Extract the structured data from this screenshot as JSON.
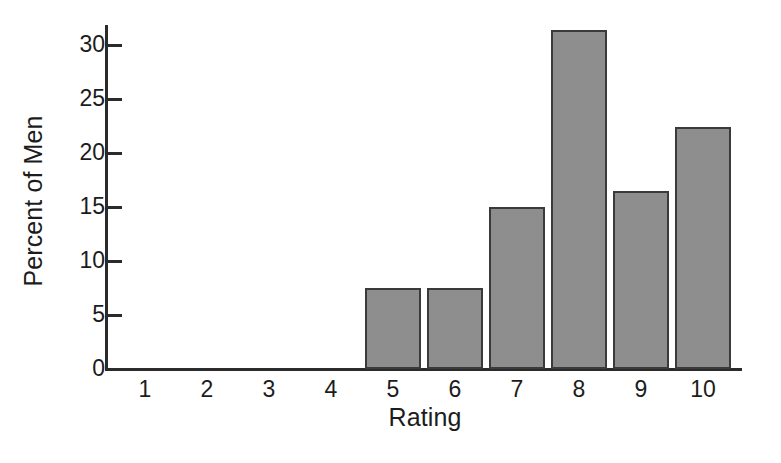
{
  "chart_data": {
    "type": "bar",
    "title": "",
    "subtitle": "",
    "xlabel": "Rating",
    "ylabel": "Percent of Men",
    "categories": [
      "1",
      "2",
      "3",
      "4",
      "5",
      "6",
      "7",
      "8",
      "9",
      "10"
    ],
    "values": [
      0,
      0,
      0,
      0,
      7.5,
      7.5,
      15.0,
      31.4,
      16.5,
      22.4
    ],
    "series": [
      {
        "name": "Percent of Men",
        "values": [
          0,
          0,
          0,
          0,
          7.5,
          7.5,
          15.0,
          31.4,
          16.5,
          22.4
        ]
      }
    ],
    "ylim": [
      0,
      31.5
    ],
    "xlim": [
      0.5,
      10.5
    ],
    "ytick_values": [
      0,
      5,
      10,
      15,
      20,
      25,
      30
    ],
    "ytick_labels": [
      "0",
      "5",
      "10",
      "15",
      "20",
      "25",
      "30"
    ],
    "xtick_labels": [
      "1",
      "2",
      "3",
      "4",
      "5",
      "6",
      "7",
      "8",
      "9",
      "10"
    ],
    "grid": false,
    "legend": false,
    "legend_position": "none",
    "annotations": [],
    "bar_fill_color": "#8c8c8c",
    "bar_edge_color": "#3a3a3a",
    "axis_color": "#2b2b2b",
    "background_color": "#ffffff",
    "tick_direction": "in",
    "spines": [
      "left",
      "bottom"
    ],
    "bar_width_fraction": 0.9
  }
}
